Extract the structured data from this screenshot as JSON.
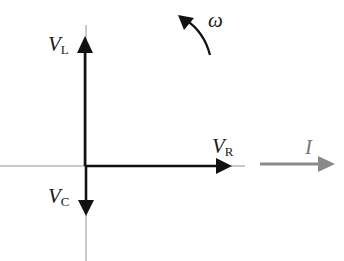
{
  "diagram": {
    "labels": {
      "omega": "ω",
      "vl_main": "V",
      "vl_sub": "L",
      "vc_main": "V",
      "vc_sub": "C",
      "vr_main": "V",
      "vr_sub": "R",
      "current": "I"
    },
    "phasors": [
      {
        "name": "V_L",
        "direction": "up",
        "color": "#111111"
      },
      {
        "name": "V_C",
        "direction": "down",
        "color": "#111111"
      },
      {
        "name": "V_R",
        "direction": "right",
        "color": "#111111"
      },
      {
        "name": "I",
        "direction": "right",
        "color": "#8a8a8a"
      }
    ],
    "rotation": "counter-clockwise",
    "colors": {
      "axis": "#777777",
      "phasor": "#111111",
      "current": "#8a8a8a",
      "background": "#ffffff"
    }
  }
}
